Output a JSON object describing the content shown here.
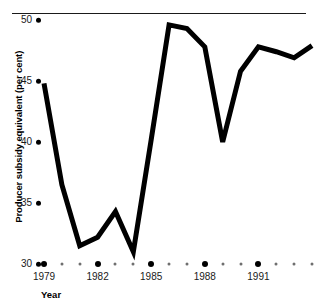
{
  "chart_data": {
    "type": "line",
    "title": "",
    "xlabel": "Year",
    "ylabel": "Producer subsidy equivalent (per cent)",
    "x": [
      1979,
      1980,
      1981,
      1982,
      1983,
      1984,
      1985,
      1986,
      1987,
      1988,
      1989,
      1990,
      1991,
      1992,
      1993,
      1994
    ],
    "values": [
      44.8,
      36.5,
      31.5,
      32.2,
      34.3,
      31.0,
      40.2,
      49.6,
      49.3,
      47.8,
      40.0,
      45.8,
      47.8,
      47.4,
      46.9,
      47.9
    ],
    "series": [
      {
        "name": "Producer subsidy equivalent",
        "values": [
          44.8,
          36.5,
          31.5,
          32.2,
          34.3,
          31.0,
          40.2,
          49.6,
          49.3,
          47.8,
          40.0,
          45.8,
          47.8,
          47.4,
          46.9,
          47.9
        ]
      }
    ],
    "xlim": [
      1979,
      1994
    ],
    "ylim": [
      30,
      50
    ],
    "ytick_values": [
      30,
      35,
      40,
      45,
      50
    ],
    "ytick_labels": [
      "30",
      "35",
      "40",
      "45",
      "50"
    ],
    "xtick_values": [
      1979,
      1980,
      1981,
      1982,
      1983,
      1984,
      1985,
      1986,
      1987,
      1988,
      1989,
      1990,
      1991,
      1992,
      1993,
      1994
    ],
    "xtick_major_values": [
      1979,
      1982,
      1985,
      1988,
      1991
    ],
    "xtick_major_labels": [
      "1979",
      "1982",
      "1985",
      "1988",
      "1991"
    ],
    "grid": false,
    "legend": null,
    "line_color": "#000000",
    "line_width_px": 5,
    "marker": "none",
    "axis_style": "dot-ticks"
  },
  "axes": {
    "y_title": "Producer subsidy equivalent (per cent)",
    "x_title": "Year"
  },
  "colors": {
    "line": "#000000",
    "text": "#1a1a1a",
    "rule": "#1a1a1a",
    "minor_tick": "#6f6f6f",
    "background": "#ffffff"
  }
}
